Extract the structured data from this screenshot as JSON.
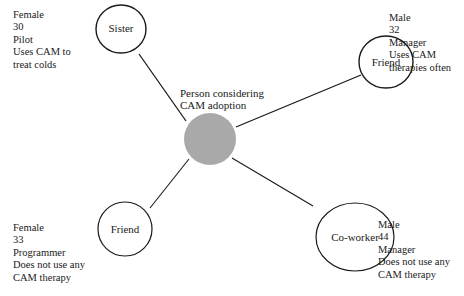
{
  "center": {
    "label_lines": [
      "Person considering",
      "CAM adoption"
    ],
    "fill_color": "#a9a9a9"
  },
  "nodes": [
    {
      "id": "sister",
      "label": "Sister",
      "info": [
        "Female",
        "30",
        "Pilot",
        "Uses CAM to",
        "treat colds"
      ]
    },
    {
      "id": "friend-top",
      "label": "Friend",
      "info": [
        "Male",
        "32",
        "Manager",
        "Uses CAM",
        "therapies often"
      ]
    },
    {
      "id": "friend-bottom",
      "label": "Friend",
      "info": [
        "Female",
        "33",
        "Programmer",
        "Does not use any",
        "CAM therapy"
      ]
    },
    {
      "id": "coworker",
      "label": "Co-worker",
      "info": [
        "Male",
        "44",
        "Manager",
        "Does not use any",
        "CAM therapy"
      ]
    }
  ]
}
